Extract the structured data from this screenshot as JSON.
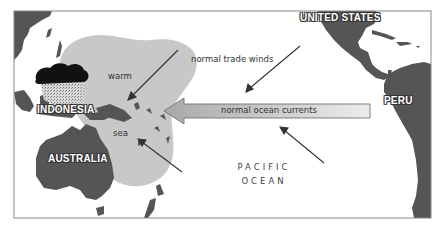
{
  "map": {
    "title": "Normal Pacific Ocean conditions",
    "labels": {
      "united_states": "UNITED STATES",
      "indonesia": "INDONESIA",
      "australia": "AUSTRALIA",
      "peru": "PERU",
      "warm": "warm",
      "sea": "sea",
      "pacific": "PACIFIC",
      "ocean": "OCEAN"
    },
    "arrows": {
      "trade_winds": "normal trade winds",
      "ocean_currents": "normal ocean currents"
    },
    "colors": {
      "land": "#555555",
      "warm_pool": "#c8c8c8",
      "current_arrow_fill_left": "#b0b0b0",
      "current_arrow_fill_right": "#e8e8e8",
      "frame": "#888888",
      "cloud": "#111111"
    }
  }
}
